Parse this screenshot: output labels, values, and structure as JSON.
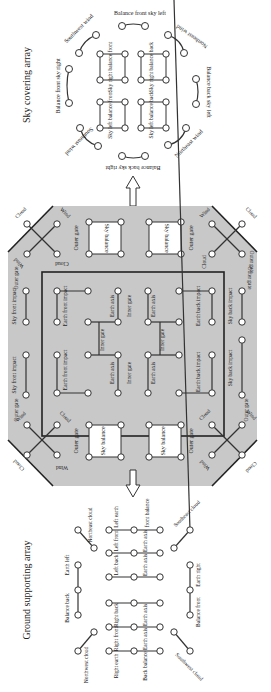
{
  "sky_array": {
    "title": "Sky covering array",
    "perimeter": [
      "Balance front sky left",
      "Northeast wind",
      "Balance back sky left",
      "Northeast wind",
      "Balance back sky right",
      "Southeast wind",
      "Balance front sky right",
      "Southwest wind"
    ],
    "boxes": [
      "Sky right balance front",
      "Sky right balance back",
      "Sky left balance front",
      "Sky left balance back"
    ]
  },
  "central": {
    "fill_color": "#c8c8c8",
    "outer_gate": "Outer gate",
    "sky_balance": "Sky balance",
    "cloud": "Cloud",
    "wind": "Wind",
    "sky_front_impact": "Sky front impact",
    "sky_back_impact": "Sky back impact",
    "earth_front_impact": "Earth front impact",
    "earth_back_impact": "Earth back impact",
    "earth_axis": "Earth axis",
    "inner_gate": "Inner gate"
  },
  "ground_array": {
    "title": "Ground supporting array",
    "labels": {
      "northeast_cloud": "Northeast cloud",
      "southeast_cloud": "Southeast cloud",
      "northwest_cloud": "Northwest cloud",
      "southwest_cloud": "Southwest cloud",
      "earth_left": "Earth left",
      "balance_back": "Balance back",
      "earth_right": "Earth right",
      "balance_front": "Balance front",
      "left_earth": "Left earth",
      "left_front": "Left front",
      "left_back": "Left back",
      "right_back": "Right back",
      "right_front": "Right front",
      "right_earth": "Right earth",
      "front_balance": "front balance",
      "back_balance": "Back balance",
      "earth_axis": "Earth axis"
    }
  }
}
